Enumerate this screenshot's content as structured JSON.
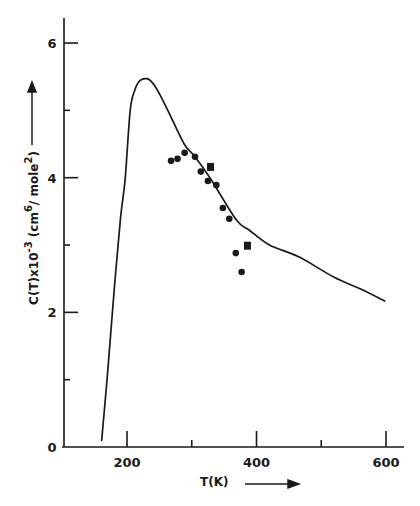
{
  "chart_data": {
    "type": "line",
    "title": "",
    "xlabel": "T(K)",
    "ylabel": "C(T)x10⁻³ (cm⁶/mole²)",
    "xlim": [
      100,
      620
    ],
    "ylim": [
      0,
      6.3
    ],
    "x_ticks": [
      200,
      300,
      400,
      500,
      600
    ],
    "x_tick_labels": [
      "200",
      "",
      "400",
      "",
      "600"
    ],
    "y_ticks": [
      0,
      1,
      2,
      3,
      4,
      5,
      6
    ],
    "y_tick_labels": [
      "0",
      "",
      "2",
      "",
      "4",
      "",
      "6"
    ],
    "grid": false,
    "legend": null,
    "series": [
      {
        "name": "theory curve",
        "kind": "line",
        "x": [
          161,
          170,
          180,
          190,
          197,
          205,
          212,
          220,
          231,
          240,
          251,
          270,
          289,
          305,
          330,
          369,
          389,
          420,
          466,
          520,
          560,
          598
        ],
        "y": [
          0.1,
          1.1,
          2.3,
          3.4,
          3.97,
          5.0,
          5.3,
          5.44,
          5.47,
          5.4,
          5.23,
          4.86,
          4.49,
          4.31,
          3.97,
          3.37,
          3.22,
          3.0,
          2.82,
          2.52,
          2.35,
          2.17
        ]
      },
      {
        "name": "experimental (circles)",
        "kind": "scatter",
        "marker": "circle",
        "x": [
          268,
          278,
          289,
          305,
          314,
          325,
          338,
          348,
          358,
          368,
          377
        ],
        "y": [
          4.25,
          4.28,
          4.37,
          4.31,
          4.09,
          3.95,
          3.89,
          3.55,
          3.39,
          2.88,
          2.6
        ]
      },
      {
        "name": "experimental (squares)",
        "kind": "scatter",
        "marker": "square",
        "x": [
          329,
          386
        ],
        "y": [
          4.16,
          2.99
        ]
      }
    ]
  },
  "labels": {
    "x_axis_title": "T(K)",
    "y_axis_title_main": "C(T)x10",
    "y_axis_title_exp": "-3",
    "y_axis_title_unit_open": "(cm",
    "y_axis_title_unit_exp6": "6",
    "y_axis_title_unit_mid": "/ mole",
    "y_axis_title_unit_exp2": "2",
    "y_axis_title_unit_close": ")"
  },
  "colors": {
    "ink": "#1a1a1a",
    "background": "#ffffff"
  }
}
